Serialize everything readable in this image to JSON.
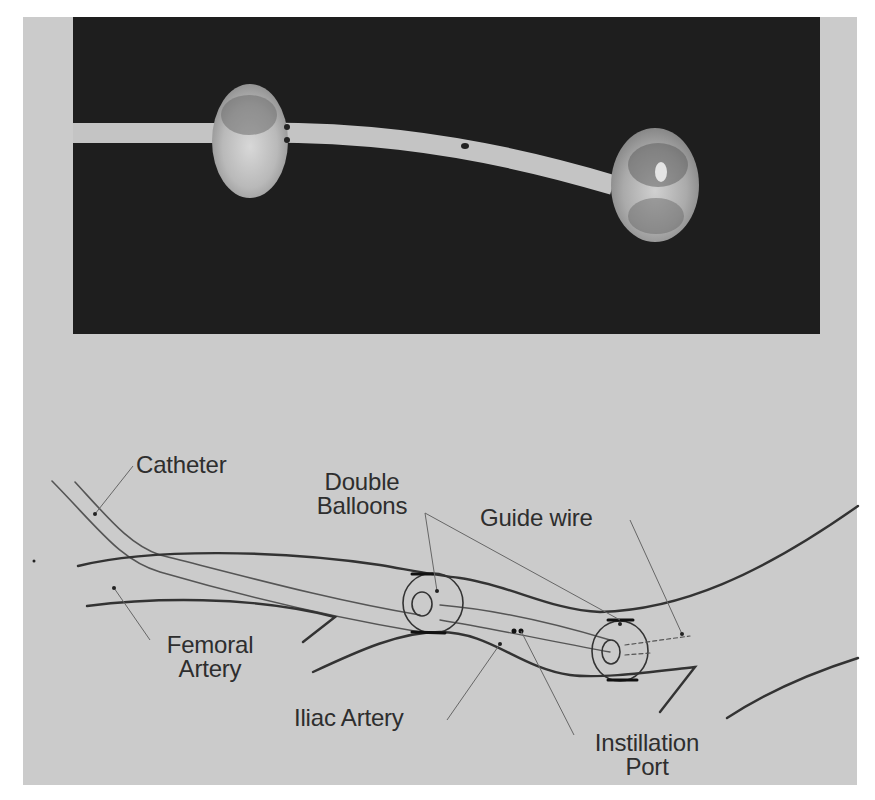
{
  "figure": {
    "photo": {
      "description": "Photograph of a double-balloon catheter on a dark background",
      "background_color": "#1e1e1e",
      "panel_color": "#cbcbcb"
    },
    "diagram": {
      "labels": {
        "catheter": "Catheter",
        "double_balloons_line1": "Double",
        "double_balloons_line2": "Balloons",
        "guide_wire": "Guide wire",
        "femoral_artery_line1": "Femoral",
        "femoral_artery_line2": "Artery",
        "iliac_artery": "Iliac Artery",
        "instillation_port_line1": "Instillation",
        "instillation_port_line2": "Port"
      }
    }
  }
}
